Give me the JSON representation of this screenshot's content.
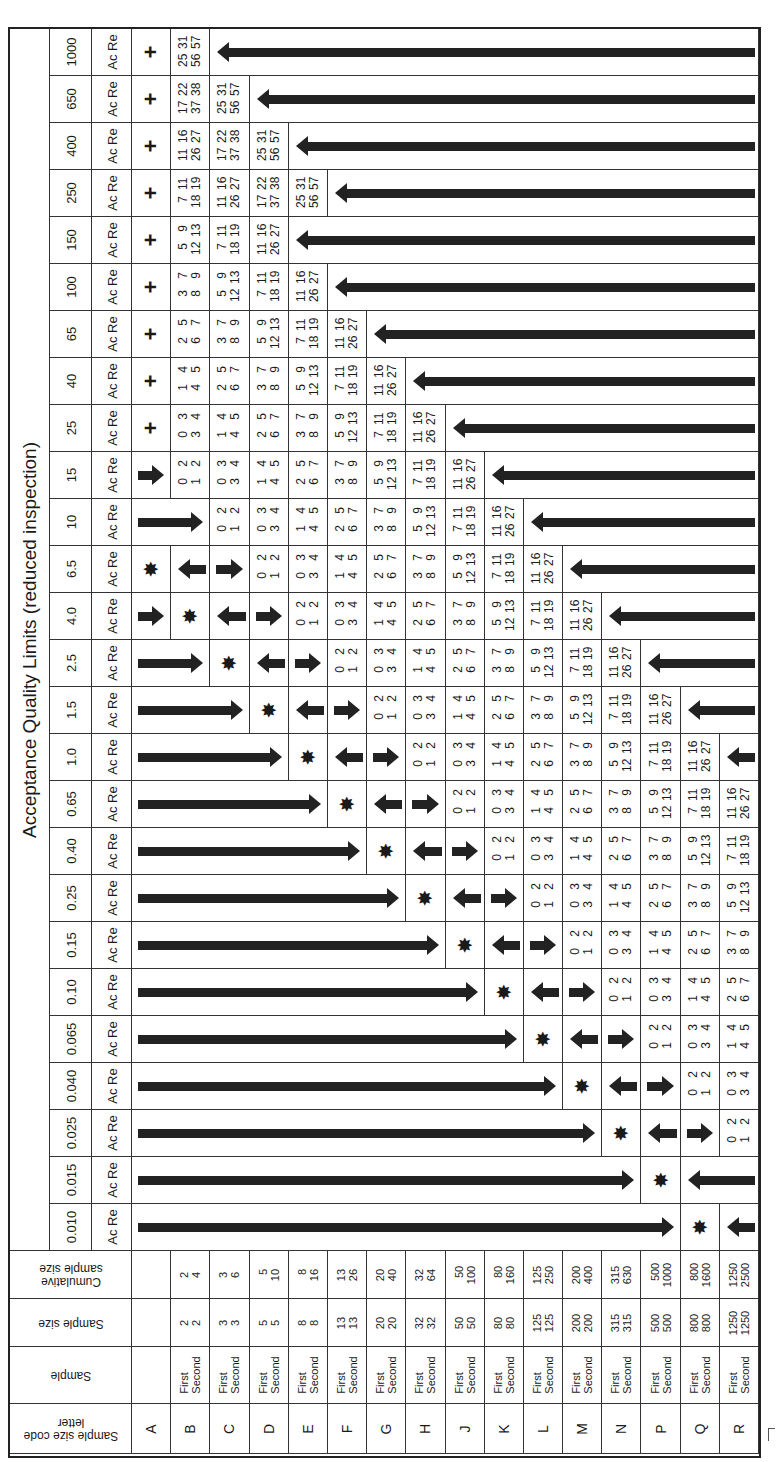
{
  "title": "Acceptance Quality Limits (reduced inspection)",
  "acre_label": "Ac Re",
  "header_labels": {
    "code_letter": "Sample size code letter",
    "sample": "Sample",
    "sample_size": "Sample size",
    "cumulative": "Cumulative sample size"
  },
  "symbols": {
    "plus": "+",
    "star": "✸",
    "arrow_right": "arrow-right",
    "arrow_left": "arrow-left"
  },
  "letters": [
    {
      "code": "A",
      "sample": [
        "",
        ""
      ],
      "size": [
        "",
        ""
      ],
      "cum": [
        "",
        ""
      ]
    },
    {
      "code": "B",
      "sample": [
        "First",
        "Second"
      ],
      "size": [
        "2",
        "2"
      ],
      "cum": [
        "2",
        "4"
      ]
    },
    {
      "code": "C",
      "sample": [
        "First",
        "Second"
      ],
      "size": [
        "3",
        "3"
      ],
      "cum": [
        "3",
        "6"
      ]
    },
    {
      "code": "D",
      "sample": [
        "First",
        "Second"
      ],
      "size": [
        "5",
        "5"
      ],
      "cum": [
        "5",
        "10"
      ]
    },
    {
      "code": "E",
      "sample": [
        "First",
        "Second"
      ],
      "size": [
        "8",
        "8"
      ],
      "cum": [
        "8",
        "16"
      ]
    },
    {
      "code": "F",
      "sample": [
        "First",
        "Second"
      ],
      "size": [
        "13",
        "13"
      ],
      "cum": [
        "13",
        "26"
      ]
    },
    {
      "code": "G",
      "sample": [
        "First",
        "Second"
      ],
      "size": [
        "20",
        "20"
      ],
      "cum": [
        "20",
        "40"
      ]
    },
    {
      "code": "H",
      "sample": [
        "First",
        "Second"
      ],
      "size": [
        "32",
        "32"
      ],
      "cum": [
        "32",
        "64"
      ]
    },
    {
      "code": "J",
      "sample": [
        "First",
        "Second"
      ],
      "size": [
        "50",
        "50"
      ],
      "cum": [
        "50",
        "100"
      ]
    },
    {
      "code": "K",
      "sample": [
        "First",
        "Second"
      ],
      "size": [
        "80",
        "80"
      ],
      "cum": [
        "80",
        "160"
      ]
    },
    {
      "code": "L",
      "sample": [
        "First",
        "Second"
      ],
      "size": [
        "125",
        "125"
      ],
      "cum": [
        "125",
        "250"
      ]
    },
    {
      "code": "M",
      "sample": [
        "First",
        "Second"
      ],
      "size": [
        "200",
        "200"
      ],
      "cum": [
        "200",
        "400"
      ]
    },
    {
      "code": "N",
      "sample": [
        "First",
        "Second"
      ],
      "size": [
        "315",
        "315"
      ],
      "cum": [
        "315",
        "630"
      ]
    },
    {
      "code": "P",
      "sample": [
        "First",
        "Second"
      ],
      "size": [
        "500",
        "500"
      ],
      "cum": [
        "500",
        "1000"
      ]
    },
    {
      "code": "Q",
      "sample": [
        "First",
        "Second"
      ],
      "size": [
        "800",
        "800"
      ],
      "cum": [
        "800",
        "1600"
      ]
    },
    {
      "code": "R",
      "sample": [
        "First",
        "Second"
      ],
      "size": [
        "1250",
        "1250"
      ],
      "cum": [
        "1250",
        "2500"
      ]
    }
  ],
  "plans": {
    "p1": [
      [
        "0",
        "2"
      ],
      [
        "1",
        "2"
      ]
    ],
    "p2": [
      [
        "0",
        "3"
      ],
      [
        "3",
        "4"
      ]
    ],
    "p3": [
      [
        "1",
        "4"
      ],
      [
        "4",
        "5"
      ]
    ],
    "p4": [
      [
        "2",
        "5"
      ],
      [
        "6",
        "7"
      ]
    ],
    "p5": [
      [
        "3",
        "7"
      ],
      [
        "8",
        "9"
      ]
    ],
    "p6": [
      [
        "5",
        "9"
      ],
      [
        "12",
        "13"
      ]
    ],
    "p7": [
      [
        "7",
        "11"
      ],
      [
        "18",
        "19"
      ]
    ],
    "p8": [
      [
        "11",
        "16"
      ],
      [
        "26",
        "27"
      ]
    ],
    "p9": [
      [
        "17",
        "22"
      ],
      [
        "37",
        "38"
      ]
    ],
    "p10": [
      [
        "25",
        "31"
      ],
      [
        "56",
        "57"
      ]
    ]
  },
  "aql_rows": [
    {
      "aql": "1000",
      "cells": [
        {
          "t": "plus"
        },
        {
          "t": "plan",
          "p": "p10"
        },
        {
          "t": "left",
          "span": 14
        }
      ]
    },
    {
      "aql": "650",
      "cells": [
        {
          "t": "plus"
        },
        {
          "t": "plan",
          "p": "p9"
        },
        {
          "t": "plan",
          "p": "p10"
        },
        {
          "t": "left",
          "span": 13
        }
      ]
    },
    {
      "aql": "400",
      "cells": [
        {
          "t": "plus"
        },
        {
          "t": "plan",
          "p": "p8"
        },
        {
          "t": "plan",
          "p": "p9"
        },
        {
          "t": "plan",
          "p": "p10"
        },
        {
          "t": "left",
          "span": 12
        }
      ]
    },
    {
      "aql": "250",
      "cells": [
        {
          "t": "plus"
        },
        {
          "t": "plan",
          "p": "p7"
        },
        {
          "t": "plan",
          "p": "p8"
        },
        {
          "t": "plan",
          "p": "p9"
        },
        {
          "t": "plan",
          "p": "p10"
        },
        {
          "t": "left",
          "span": 11
        }
      ]
    },
    {
      "aql": "150",
      "cells": [
        {
          "t": "plus"
        },
        {
          "t": "plan",
          "p": "p6"
        },
        {
          "t": "plan",
          "p": "p7"
        },
        {
          "t": "plan",
          "p": "p8"
        },
        {
          "t": "left",
          "span": 12
        }
      ]
    },
    {
      "aql": "100",
      "cells": [
        {
          "t": "plus"
        },
        {
          "t": "plan",
          "p": "p5"
        },
        {
          "t": "plan",
          "p": "p6"
        },
        {
          "t": "plan",
          "p": "p7"
        },
        {
          "t": "plan",
          "p": "p8"
        },
        {
          "t": "left",
          "span": 11
        }
      ]
    },
    {
      "aql": "65",
      "cells": [
        {
          "t": "plus"
        },
        {
          "t": "plan",
          "p": "p4"
        },
        {
          "t": "plan",
          "p": "p5"
        },
        {
          "t": "plan",
          "p": "p6"
        },
        {
          "t": "plan",
          "p": "p7"
        },
        {
          "t": "plan",
          "p": "p8"
        },
        {
          "t": "left",
          "span": 10
        }
      ]
    },
    {
      "aql": "40",
      "cells": [
        {
          "t": "plus"
        },
        {
          "t": "plan",
          "p": "p3"
        },
        {
          "t": "plan",
          "p": "p4"
        },
        {
          "t": "plan",
          "p": "p5"
        },
        {
          "t": "plan",
          "p": "p6"
        },
        {
          "t": "plan",
          "p": "p7"
        },
        {
          "t": "plan",
          "p": "p8"
        },
        {
          "t": "left",
          "span": 9
        }
      ]
    },
    {
      "aql": "25",
      "cells": [
        {
          "t": "plus"
        },
        {
          "t": "plan",
          "p": "p2"
        },
        {
          "t": "plan",
          "p": "p3"
        },
        {
          "t": "plan",
          "p": "p4"
        },
        {
          "t": "plan",
          "p": "p5"
        },
        {
          "t": "plan",
          "p": "p6"
        },
        {
          "t": "plan",
          "p": "p7"
        },
        {
          "t": "plan",
          "p": "p8"
        },
        {
          "t": "left",
          "span": 8
        }
      ]
    },
    {
      "aql": "15",
      "cells": [
        {
          "t": "right",
          "span": 1
        },
        {
          "t": "plan",
          "p": "p1"
        },
        {
          "t": "plan",
          "p": "p2"
        },
        {
          "t": "plan",
          "p": "p3"
        },
        {
          "t": "plan",
          "p": "p4"
        },
        {
          "t": "plan",
          "p": "p5"
        },
        {
          "t": "plan",
          "p": "p6"
        },
        {
          "t": "plan",
          "p": "p7"
        },
        {
          "t": "plan",
          "p": "p8"
        },
        {
          "t": "left",
          "span": 7
        }
      ]
    },
    {
      "aql": "10",
      "cells": [
        {
          "t": "right",
          "span": 2
        },
        {
          "t": "plan",
          "p": "p1"
        },
        {
          "t": "plan",
          "p": "p2"
        },
        {
          "t": "plan",
          "p": "p3"
        },
        {
          "t": "plan",
          "p": "p4"
        },
        {
          "t": "plan",
          "p": "p5"
        },
        {
          "t": "plan",
          "p": "p6"
        },
        {
          "t": "plan",
          "p": "p7"
        },
        {
          "t": "plan",
          "p": "p8"
        },
        {
          "t": "left",
          "span": 6
        }
      ]
    },
    {
      "aql": "6.5",
      "cells": [
        {
          "t": "star"
        },
        {
          "t": "left",
          "span": 1
        },
        {
          "t": "right",
          "span": 1
        },
        {
          "t": "plan",
          "p": "p1"
        },
        {
          "t": "plan",
          "p": "p2"
        },
        {
          "t": "plan",
          "p": "p3"
        },
        {
          "t": "plan",
          "p": "p4"
        },
        {
          "t": "plan",
          "p": "p5"
        },
        {
          "t": "plan",
          "p": "p6"
        },
        {
          "t": "plan",
          "p": "p7"
        },
        {
          "t": "plan",
          "p": "p8"
        },
        {
          "t": "left",
          "span": 5
        }
      ]
    },
    {
      "aql": "4.0",
      "cells": [
        {
          "t": "right",
          "span": 1
        },
        {
          "t": "star"
        },
        {
          "t": "left",
          "span": 1
        },
        {
          "t": "right",
          "span": 1
        },
        {
          "t": "plan",
          "p": "p1"
        },
        {
          "t": "plan",
          "p": "p2"
        },
        {
          "t": "plan",
          "p": "p3"
        },
        {
          "t": "plan",
          "p": "p4"
        },
        {
          "t": "plan",
          "p": "p5"
        },
        {
          "t": "plan",
          "p": "p6"
        },
        {
          "t": "plan",
          "p": "p7"
        },
        {
          "t": "plan",
          "p": "p8"
        },
        {
          "t": "left",
          "span": 4
        }
      ]
    },
    {
      "aql": "2.5",
      "cells": [
        {
          "t": "right",
          "span": 2
        },
        {
          "t": "star"
        },
        {
          "t": "left",
          "span": 1
        },
        {
          "t": "right",
          "span": 1
        },
        {
          "t": "plan",
          "p": "p1"
        },
        {
          "t": "plan",
          "p": "p2"
        },
        {
          "t": "plan",
          "p": "p3"
        },
        {
          "t": "plan",
          "p": "p4"
        },
        {
          "t": "plan",
          "p": "p5"
        },
        {
          "t": "plan",
          "p": "p6"
        },
        {
          "t": "plan",
          "p": "p7"
        },
        {
          "t": "plan",
          "p": "p8"
        },
        {
          "t": "left",
          "span": 3
        }
      ]
    },
    {
      "aql": "1.5",
      "cells": [
        {
          "t": "right",
          "span": 3
        },
        {
          "t": "star"
        },
        {
          "t": "left",
          "span": 1
        },
        {
          "t": "right",
          "span": 1
        },
        {
          "t": "plan",
          "p": "p1"
        },
        {
          "t": "plan",
          "p": "p2"
        },
        {
          "t": "plan",
          "p": "p3"
        },
        {
          "t": "plan",
          "p": "p4"
        },
        {
          "t": "plan",
          "p": "p5"
        },
        {
          "t": "plan",
          "p": "p6"
        },
        {
          "t": "plan",
          "p": "p7"
        },
        {
          "t": "plan",
          "p": "p8"
        },
        {
          "t": "left",
          "span": 2
        }
      ]
    },
    {
      "aql": "1.0",
      "cells": [
        {
          "t": "right",
          "span": 4
        },
        {
          "t": "star"
        },
        {
          "t": "left",
          "span": 1
        },
        {
          "t": "right",
          "span": 1
        },
        {
          "t": "plan",
          "p": "p1"
        },
        {
          "t": "plan",
          "p": "p2"
        },
        {
          "t": "plan",
          "p": "p3"
        },
        {
          "t": "plan",
          "p": "p4"
        },
        {
          "t": "plan",
          "p": "p5"
        },
        {
          "t": "plan",
          "p": "p6"
        },
        {
          "t": "plan",
          "p": "p7"
        },
        {
          "t": "plan",
          "p": "p8"
        },
        {
          "t": "left",
          "span": 1
        }
      ]
    },
    {
      "aql": "0.65",
      "cells": [
        {
          "t": "right",
          "span": 5
        },
        {
          "t": "star"
        },
        {
          "t": "left",
          "span": 1
        },
        {
          "t": "right",
          "span": 1
        },
        {
          "t": "plan",
          "p": "p1"
        },
        {
          "t": "plan",
          "p": "p2"
        },
        {
          "t": "plan",
          "p": "p3"
        },
        {
          "t": "plan",
          "p": "p4"
        },
        {
          "t": "plan",
          "p": "p5"
        },
        {
          "t": "plan",
          "p": "p6"
        },
        {
          "t": "plan",
          "p": "p7"
        },
        {
          "t": "plan",
          "p": "p8"
        }
      ]
    },
    {
      "aql": "0.40",
      "cells": [
        {
          "t": "right",
          "span": 6
        },
        {
          "t": "star"
        },
        {
          "t": "left",
          "span": 1
        },
        {
          "t": "right",
          "span": 1
        },
        {
          "t": "plan",
          "p": "p1"
        },
        {
          "t": "plan",
          "p": "p2"
        },
        {
          "t": "plan",
          "p": "p3"
        },
        {
          "t": "plan",
          "p": "p4"
        },
        {
          "t": "plan",
          "p": "p5"
        },
        {
          "t": "plan",
          "p": "p6"
        },
        {
          "t": "plan",
          "p": "p7"
        }
      ]
    },
    {
      "aql": "0.25",
      "cells": [
        {
          "t": "right",
          "span": 7
        },
        {
          "t": "star"
        },
        {
          "t": "left",
          "span": 1
        },
        {
          "t": "right",
          "span": 1
        },
        {
          "t": "plan",
          "p": "p1"
        },
        {
          "t": "plan",
          "p": "p2"
        },
        {
          "t": "plan",
          "p": "p3"
        },
        {
          "t": "plan",
          "p": "p4"
        },
        {
          "t": "plan",
          "p": "p5"
        },
        {
          "t": "plan",
          "p": "p6"
        }
      ]
    },
    {
      "aql": "0.15",
      "cells": [
        {
          "t": "right",
          "span": 8
        },
        {
          "t": "star"
        },
        {
          "t": "left",
          "span": 1
        },
        {
          "t": "right",
          "span": 1
        },
        {
          "t": "plan",
          "p": "p1"
        },
        {
          "t": "plan",
          "p": "p2"
        },
        {
          "t": "plan",
          "p": "p3"
        },
        {
          "t": "plan",
          "p": "p4"
        },
        {
          "t": "plan",
          "p": "p5"
        }
      ]
    },
    {
      "aql": "0.10",
      "cells": [
        {
          "t": "right",
          "span": 9
        },
        {
          "t": "star"
        },
        {
          "t": "left",
          "span": 1
        },
        {
          "t": "right",
          "span": 1
        },
        {
          "t": "plan",
          "p": "p1"
        },
        {
          "t": "plan",
          "p": "p2"
        },
        {
          "t": "plan",
          "p": "p3"
        },
        {
          "t": "plan",
          "p": "p4"
        }
      ]
    },
    {
      "aql": "0.065",
      "cells": [
        {
          "t": "right",
          "span": 10
        },
        {
          "t": "star"
        },
        {
          "t": "left",
          "span": 1
        },
        {
          "t": "right",
          "span": 1
        },
        {
          "t": "plan",
          "p": "p1"
        },
        {
          "t": "plan",
          "p": "p2"
        },
        {
          "t": "plan",
          "p": "p3"
        }
      ]
    },
    {
      "aql": "0.040",
      "cells": [
        {
          "t": "right",
          "span": 11
        },
        {
          "t": "star"
        },
        {
          "t": "left",
          "span": 1
        },
        {
          "t": "right",
          "span": 1
        },
        {
          "t": "plan",
          "p": "p1"
        },
        {
          "t": "plan",
          "p": "p2"
        }
      ]
    },
    {
      "aql": "0.025",
      "cells": [
        {
          "t": "right",
          "span": 12
        },
        {
          "t": "star"
        },
        {
          "t": "left",
          "span": 1
        },
        {
          "t": "right",
          "span": 1
        },
        {
          "t": "plan",
          "p": "p1"
        }
      ]
    },
    {
      "aql": "0.015",
      "cells": [
        {
          "t": "right",
          "span": 13
        },
        {
          "t": "star"
        },
        {
          "t": "left",
          "span": 2
        }
      ]
    },
    {
      "aql": "0.010",
      "cells": [
        {
          "t": "right",
          "span": 14
        },
        {
          "t": "star"
        },
        {
          "t": "left",
          "span": 1
        }
      ]
    }
  ]
}
